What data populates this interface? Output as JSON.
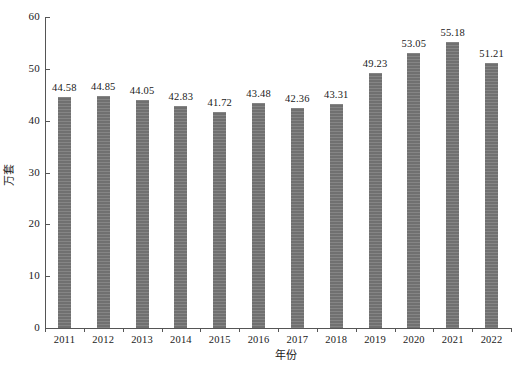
{
  "chart_data": {
    "type": "bar",
    "title": "",
    "xlabel": "年份",
    "ylabel": "万套",
    "categories": [
      "2011",
      "2012",
      "2013",
      "2014",
      "2015",
      "2016",
      "2017",
      "2018",
      "2019",
      "2020",
      "2021",
      "2022"
    ],
    "values": [
      44.58,
      44.85,
      44.05,
      42.83,
      41.72,
      43.48,
      42.36,
      43.31,
      49.23,
      53.05,
      55.18,
      51.21
    ],
    "value_labels": [
      "44.58",
      "44.85",
      "44.05",
      "42.83",
      "41.72",
      "43.48",
      "42.36",
      "43.31",
      "49.23",
      "53.05",
      "55.18",
      "51.21"
    ],
    "ylim": [
      0,
      60
    ],
    "yticks": [
      0,
      10,
      20,
      30,
      40,
      50,
      60
    ],
    "ytick_labels": [
      "0",
      "10",
      "20",
      "30",
      "40",
      "50",
      "60"
    ],
    "grid": false,
    "legend": "none",
    "bar_color": "#767676",
    "axis_color": "#555555",
    "background_color": "#ffffff"
  }
}
